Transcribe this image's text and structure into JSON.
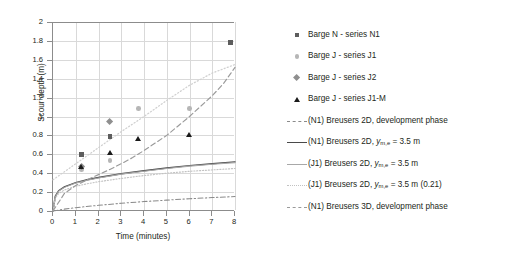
{
  "chart_data": {
    "type": "scatter",
    "title": "",
    "xlabel": "Time (minutes)",
    "ylabel": "Scour depth (m)",
    "xlim": [
      0,
      8
    ],
    "ylim": [
      0,
      2
    ],
    "xticks": [
      0,
      1,
      2,
      3,
      4,
      5,
      6,
      7,
      8
    ],
    "yticks": [
      0,
      0.2,
      0.4,
      0.6,
      0.8,
      1,
      1.2,
      1.4,
      1.6,
      1.8,
      2
    ],
    "ytick_labels": [
      "0",
      "0.2",
      "0.4",
      "0.6",
      "0.8",
      "1",
      "1.2",
      "1.4",
      "1.6",
      "1.8",
      "2"
    ],
    "xtick_labels": [
      "0",
      "1",
      "2",
      "3",
      "4",
      "5",
      "6",
      "7",
      "8"
    ],
    "grid": true,
    "legend_position": "right",
    "series": [
      {
        "name": "Barge N - series N1",
        "marker": "square",
        "color": "#5d5d5d",
        "points": [
          [
            1.25,
            0.595
          ],
          [
            2.5,
            0.79
          ],
          [
            7.8,
            1.78
          ]
        ]
      },
      {
        "name": "Barge J - series J1",
        "marker": "circle",
        "color": "#b6b6b6",
        "points": [
          [
            1.25,
            0.44
          ],
          [
            2.5,
            0.535
          ],
          [
            3.75,
            1.085
          ],
          [
            6.0,
            1.085
          ]
        ]
      },
      {
        "name": "Barge J - series J2",
        "marker": "diamond",
        "color": "#8f8f8f",
        "points": [
          [
            1.25,
            0.47
          ],
          [
            2.5,
            0.945
          ]
        ]
      },
      {
        "name": "Barge J - series J1-M",
        "marker": "triangle",
        "color": "#1a1a1a",
        "points": [
          [
            1.25,
            0.465
          ],
          [
            2.5,
            0.615
          ],
          [
            3.75,
            0.765
          ],
          [
            6.0,
            0.81
          ]
        ]
      }
    ],
    "curves": [
      {
        "name": "(N1) Breusers 2D, development phase",
        "style": "dash-dot",
        "color": "#8a8a8a",
        "points": [
          [
            0,
            0
          ],
          [
            0.5,
            0.02
          ],
          [
            1,
            0.035
          ],
          [
            2,
            0.06
          ],
          [
            3,
            0.082
          ],
          [
            4,
            0.1
          ],
          [
            5,
            0.115
          ],
          [
            6,
            0.13
          ],
          [
            7,
            0.142
          ],
          [
            8,
            0.153
          ]
        ]
      },
      {
        "name": "(N1) Breusers 2D, y_m,e = 3.5 m",
        "style": "solid",
        "color": "#4a4a4a",
        "points": [
          [
            0,
            0
          ],
          [
            0.1,
            0.155
          ],
          [
            0.25,
            0.215
          ],
          [
            0.5,
            0.255
          ],
          [
            1,
            0.3
          ],
          [
            1.5,
            0.33
          ],
          [
            2,
            0.355
          ],
          [
            3,
            0.395
          ],
          [
            4,
            0.425
          ],
          [
            5,
            0.455
          ],
          [
            6,
            0.48
          ],
          [
            7,
            0.5
          ],
          [
            8,
            0.52
          ]
        ]
      },
      {
        "name": "(J1) Breusers 2D, y_m,e = 3.5 m",
        "style": "solid-light",
        "color": "#a8a8a8",
        "points": [
          [
            0,
            0
          ],
          [
            0.1,
            0.15
          ],
          [
            0.25,
            0.21
          ],
          [
            0.5,
            0.25
          ],
          [
            1,
            0.295
          ],
          [
            1.5,
            0.325
          ],
          [
            2,
            0.35
          ],
          [
            3,
            0.39
          ],
          [
            4,
            0.42
          ],
          [
            5,
            0.45
          ],
          [
            6,
            0.475
          ],
          [
            7,
            0.495
          ],
          [
            8,
            0.512
          ]
        ]
      },
      {
        "name": "(J1) Breusers 2D, y_m,e = 3.5 m (0.21)",
        "style": "dotted",
        "color": "#c2c2c2",
        "points": [
          [
            0,
            0
          ],
          [
            0.1,
            0.135
          ],
          [
            0.25,
            0.185
          ],
          [
            0.5,
            0.222
          ],
          [
            1,
            0.262
          ],
          [
            1.5,
            0.288
          ],
          [
            2,
            0.31
          ],
          [
            3,
            0.345
          ],
          [
            4,
            0.375
          ],
          [
            5,
            0.4
          ],
          [
            6,
            0.42
          ],
          [
            7,
            0.435
          ],
          [
            8,
            0.45
          ]
        ]
      },
      {
        "name": "(N1) Breusers 3D, development phase",
        "style": "dashed",
        "color": "#9a9a9a",
        "points": [
          [
            0,
            0
          ],
          [
            0.5,
            0.185
          ],
          [
            1,
            0.27
          ],
          [
            1.5,
            0.33
          ],
          [
            2,
            0.385
          ],
          [
            2.5,
            0.44
          ],
          [
            3,
            0.5
          ],
          [
            3.5,
            0.565
          ],
          [
            4,
            0.64
          ],
          [
            4.5,
            0.72
          ],
          [
            5,
            0.8
          ],
          [
            5.5,
            0.9
          ],
          [
            6,
            1.0
          ],
          [
            6.5,
            1.11
          ],
          [
            7,
            1.22
          ],
          [
            7.5,
            1.35
          ],
          [
            8,
            1.52
          ]
        ]
      },
      {
        "name": "upper-trend",
        "style": "dotted-light",
        "color": "#d0d0d0",
        "points": [
          [
            0,
            0.33
          ],
          [
            1,
            0.5
          ],
          [
            2,
            0.67
          ],
          [
            3,
            0.84
          ],
          [
            4,
            1.0
          ],
          [
            5,
            1.17
          ],
          [
            6,
            1.33
          ],
          [
            7,
            1.46
          ],
          [
            8,
            1.55
          ]
        ]
      }
    ],
    "legend": [
      {
        "label": "Barge N - series N1",
        "symbol": "square"
      },
      {
        "label": "Barge J - series J1",
        "symbol": "circle"
      },
      {
        "label": "Barge J - series J2",
        "symbol": "diamond"
      },
      {
        "label": "Barge J - series J1-M",
        "symbol": "triangle"
      },
      {
        "label": "(N1) Breusers 2D, development phase",
        "symbol": "line-dash-dot"
      },
      {
        "label_html": "(N1) Breusers 2D, <i>y</i><sub>m,e</sub> = 3.5 m",
        "symbol": "line-solid-dark"
      },
      {
        "label_html": "(J1) Breusers 2D, <i>y</i><sub>m,e</sub> = 3.5 m",
        "symbol": "line-solid-light"
      },
      {
        "label_html": "(J1) Breusers 2D, <i>y</i><sub>m,e</sub> = 3.5 m (0.21)",
        "symbol": "line-dotted"
      },
      {
        "label": "(N1) Breusers 3D, development phase",
        "symbol": "line-dashed"
      }
    ]
  }
}
